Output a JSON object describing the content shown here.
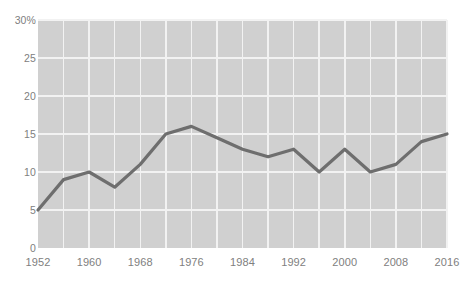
{
  "chart_data": {
    "type": "line",
    "title": "",
    "subtitle": "",
    "xlabel": "",
    "ylabel": "",
    "x": [
      1952,
      1956,
      1960,
      1964,
      1968,
      1972,
      1976,
      1980,
      1984,
      1988,
      1992,
      1996,
      2000,
      2004,
      2008,
      2012,
      2016
    ],
    "values": [
      5,
      9,
      10,
      8,
      11,
      15,
      16,
      14.5,
      13,
      12,
      13,
      10,
      13,
      10,
      11,
      14,
      15
    ],
    "series": [
      {
        "name": "",
        "values": [
          5,
          9,
          10,
          8,
          11,
          15,
          16,
          14.5,
          13,
          12,
          13,
          10,
          13,
          10,
          11,
          14,
          15
        ]
      }
    ],
    "xlim": [
      1952,
      2016
    ],
    "ylim": [
      0,
      30
    ],
    "y_ticks": [
      0,
      5,
      10,
      15,
      20,
      25,
      30
    ],
    "y_tick_labels": [
      "0",
      "5",
      "10",
      "15",
      "20",
      "25",
      "30%"
    ],
    "x_ticks": [
      1952,
      1960,
      1968,
      1976,
      1984,
      1992,
      2000,
      2008,
      2016
    ],
    "x_tick_labels": [
      "1952",
      "1960",
      "1968",
      "1976",
      "1984",
      "1992",
      "2000",
      "2008",
      "2016"
    ],
    "x_gridlines": [
      1952,
      1956,
      1960,
      1964,
      1968,
      1972,
      1976,
      1980,
      1984,
      1988,
      1992,
      1996,
      2000,
      2004,
      2008,
      2012,
      2016
    ],
    "grid": true,
    "legend": "none",
    "line_color": "#6e6e6e",
    "plot_background": "#d0d0d0",
    "grid_color": "#f2f2f2",
    "tick_label_color": "#808080",
    "figure_background": "#ffffff"
  }
}
